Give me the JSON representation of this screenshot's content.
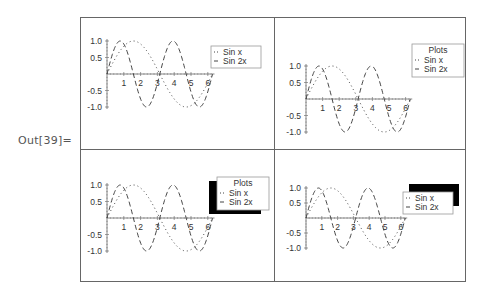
{
  "output_label": "Out[39]=",
  "chart_data": [
    {
      "type": "line",
      "position": "top-left",
      "xlabel": "",
      "ylabel": "",
      "xlim": [
        0,
        6.28
      ],
      "ylim": [
        -1.0,
        1.0
      ],
      "x_ticks": [
        "1",
        "2",
        "3",
        "4",
        "5",
        "6"
      ],
      "y_ticks": [
        "1.0",
        "0.5",
        "-0.5",
        "-1.0"
      ],
      "series": [
        {
          "name": "Sin x",
          "function": "sin(x)",
          "style": "dotted"
        },
        {
          "name": "Sin 2x",
          "function": "sin(2x)",
          "style": "dashed"
        }
      ],
      "legend": {
        "title": "",
        "entries": [
          "Sin x",
          "Sin 2x"
        ],
        "shadow": false,
        "position": "right"
      }
    },
    {
      "type": "line",
      "position": "top-right",
      "xlim": [
        0,
        6.28
      ],
      "ylim": [
        -1.0,
        1.0
      ],
      "x_ticks": [
        "1",
        "2",
        "3",
        "4",
        "5",
        "6"
      ],
      "y_ticks": [
        "1.0",
        "0.5",
        "-0.5",
        "-1.0"
      ],
      "series": [
        {
          "name": "Sin x",
          "function": "sin(x)",
          "style": "dotted"
        },
        {
          "name": "Sin 2x",
          "function": "sin(2x)",
          "style": "dashed"
        }
      ],
      "legend": {
        "title": "Plots",
        "entries": [
          "Sin x",
          "Sin 2x"
        ],
        "shadow": false,
        "position": "right"
      }
    },
    {
      "type": "line",
      "position": "bottom-left",
      "xlim": [
        0,
        6.28
      ],
      "ylim": [
        -1.0,
        1.0
      ],
      "x_ticks": [
        "1",
        "2",
        "3",
        "4",
        "5",
        "6"
      ],
      "y_ticks": [
        "1.0",
        "0.5",
        "-0.5",
        "-1.0"
      ],
      "series": [
        {
          "name": "Sin x",
          "function": "sin(x)",
          "style": "dotted"
        },
        {
          "name": "Sin 2x",
          "function": "sin(2x)",
          "style": "dashed"
        }
      ],
      "legend": {
        "title": "Plots",
        "entries": [
          "Sin x",
          "Sin 2x"
        ],
        "shadow": true,
        "shadow_offset": "bottom-left",
        "position": "right"
      }
    },
    {
      "type": "line",
      "position": "bottom-right",
      "xlim": [
        0,
        6.28
      ],
      "ylim": [
        -1.0,
        1.0
      ],
      "x_ticks": [
        "1",
        "2",
        "3",
        "4",
        "5",
        "6"
      ],
      "y_ticks": [
        "1.0",
        "0.5",
        "-0.5",
        "-1.0"
      ],
      "series": [
        {
          "name": "Sin x",
          "function": "sin(x)",
          "style": "dotted"
        },
        {
          "name": "Sin 2x",
          "function": "sin(2x)",
          "style": "dashed"
        }
      ],
      "legend": {
        "title": "",
        "entries": [
          "Sin x",
          "Sin 2x"
        ],
        "shadow": true,
        "shadow_offset": "top-right",
        "position": "right"
      }
    }
  ],
  "colors": {
    "line": "#444444",
    "axis": "#888888",
    "border": "#666666",
    "shadow": "#000000"
  }
}
